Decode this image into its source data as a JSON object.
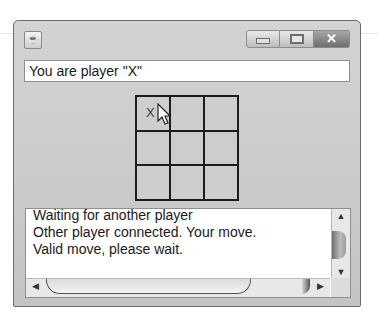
{
  "window": {
    "title": "",
    "app_icon": "java-coffee-cup-icon",
    "controls": {
      "minimize_icon": "minimize-icon",
      "maximize_icon": "maximize-icon",
      "close_icon": "close-icon",
      "close_glyph": "✕"
    }
  },
  "status": {
    "text": "You are player \"X\""
  },
  "board": {
    "cells": [
      "X",
      "",
      "",
      "",
      "",
      "",
      "",
      "",
      ""
    ]
  },
  "log": {
    "lines": [
      "Waiting for another player",
      "Other player connected. Your move.",
      "Valid move, please wait."
    ]
  },
  "scrollbars": {
    "up_arrow": "▲",
    "down_arrow": "▼",
    "left_arrow": "◀",
    "right_arrow": "▶"
  },
  "colors": {
    "window_bg": "#c9c9c9",
    "field_bg": "#ffffff",
    "grid_line": "#1c1c1c"
  }
}
